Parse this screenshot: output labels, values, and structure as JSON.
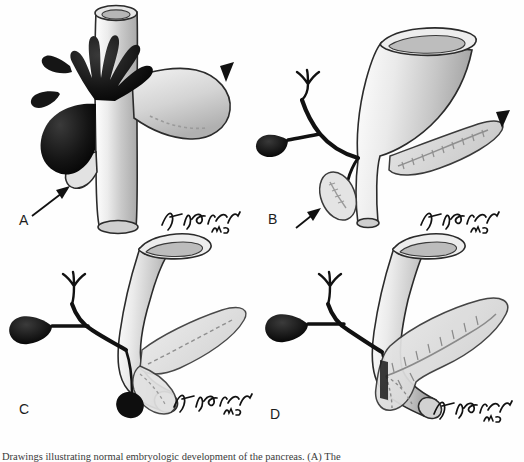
{
  "figure": {
    "domain": "medical-illustration",
    "background_color": "#fefefe",
    "ink_color": "#1a1a1a",
    "organ_fill_light": "#dcdcdc",
    "organ_fill_mid": "#c2c2c2",
    "organ_fill_dark": "#1b1b1b",
    "outline_color": "#2b2b2b",
    "panel_count": 4
  },
  "panels": [
    {
      "id": "A",
      "label": "A",
      "title": "",
      "signature": "Jon Sprecher MD",
      "structures": [
        "hepatic-diverticulum",
        "gallbladder-bud",
        "foregut-duodenum",
        "dorsal-pancreatic-bud",
        "ventral-pancreatic-bud"
      ],
      "annotations": [
        {
          "marker": "arrowhead",
          "target": "dorsal-pancreatic-bud",
          "direction": "down-left"
        },
        {
          "marker": "arrow",
          "target": "ventral-pancreatic-bud",
          "direction": "up-right"
        }
      ]
    },
    {
      "id": "B",
      "label": "B",
      "title": "",
      "signature": "Jon Sprecher MD",
      "structures": [
        "hepatic-ducts",
        "gallbladder",
        "cystic-duct",
        "common-bile-duct",
        "duodenum-funnel",
        "dorsal-pancreas",
        "ventral-pancreas"
      ],
      "annotations": [
        {
          "marker": "arrowhead",
          "target": "dorsal-pancreas",
          "direction": "down-left"
        },
        {
          "marker": "arrow",
          "target": "ventral-pancreas",
          "direction": "up-right"
        }
      ]
    },
    {
      "id": "C",
      "label": "C",
      "title": "",
      "signature": "Jon Sprecher MD",
      "structures": [
        "hepatic-ducts",
        "gallbladder",
        "cystic-duct",
        "common-bile-duct",
        "duodenum-curved",
        "rotating-ventral-pancreas",
        "dorsal-pancreas"
      ],
      "annotations": []
    },
    {
      "id": "D",
      "label": "D",
      "title": "",
      "signature": "Jon Sprecher MD",
      "structures": [
        "hepatic-ducts",
        "gallbladder",
        "cystic-duct",
        "common-bile-duct",
        "duodenum-curved",
        "fused-pancreas",
        "main-pancreatic-duct",
        "duct-side-branches"
      ],
      "annotations": []
    }
  ],
  "caption": {
    "text": "Drawings illustrating normal embryologic development of the pancreas. (A) The",
    "truncated": true
  }
}
